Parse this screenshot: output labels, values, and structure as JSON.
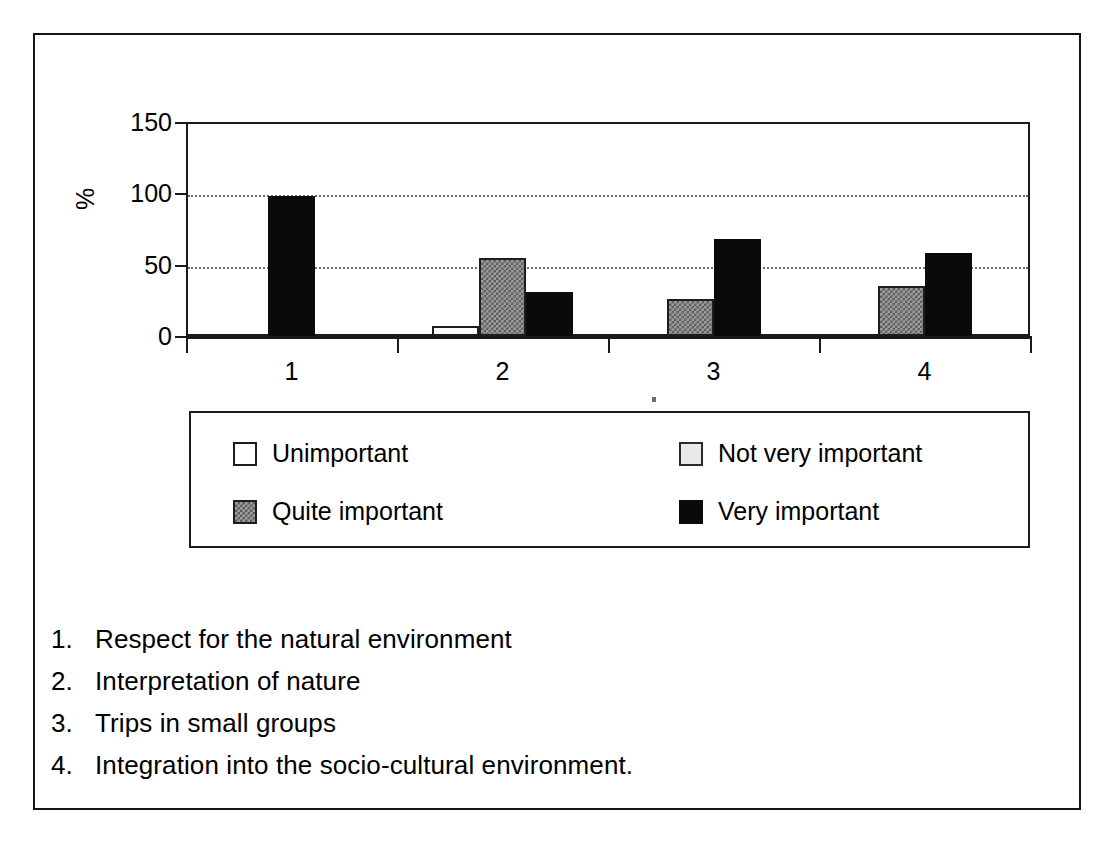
{
  "figure": {
    "y_axis_label": "%",
    "scan_speck": "speck"
  },
  "chart_data": {
    "type": "bar",
    "title": "",
    "xlabel": "",
    "ylabel": "%",
    "ylim": [
      0,
      150
    ],
    "yticks": [
      0,
      50,
      100,
      150
    ],
    "ytick_labels": [
      "0",
      "50",
      "100",
      "150"
    ],
    "grid": "horizontal dotted gridlines at 50 and 100",
    "legend_position": "below plot, 2x2 box",
    "categories": [
      "1",
      "2",
      "3",
      "4"
    ],
    "category_labels": [
      "Respect for the natural environment",
      "Interpretation of nature",
      "Trips in small groups",
      "Integration into the socio-cultural environment."
    ],
    "series": [
      {
        "name": "Unimportant",
        "color": "#ffffff",
        "values": [
          0,
          7,
          0,
          0
        ]
      },
      {
        "name": "Not very important",
        "color": "#e9e9e9",
        "values": [
          0,
          0,
          0,
          0
        ]
      },
      {
        "name": "Quite important",
        "color": "#8a8a8a",
        "values": [
          0,
          55,
          26,
          35
        ]
      },
      {
        "name": "Very important",
        "color": "#0a0a0a",
        "values": [
          98,
          31,
          68,
          58
        ]
      }
    ]
  },
  "legend": {
    "items": [
      {
        "label": "Unimportant",
        "swatch": "sw-unimportant"
      },
      {
        "label": "Not very important",
        "swatch": "sw-notvery"
      },
      {
        "label": "Quite important",
        "swatch": "sw-quite"
      },
      {
        "label": "Very important",
        "swatch": "sw-very"
      }
    ]
  },
  "caption": {
    "items": [
      {
        "num": "1.",
        "text": "Respect for the natural environment"
      },
      {
        "num": "2.",
        "text": "Interpretation of nature"
      },
      {
        "num": "3.",
        "text": "Trips in small groups"
      },
      {
        "num": "4.",
        "text": "Integration into the socio-cultural environment."
      }
    ]
  }
}
